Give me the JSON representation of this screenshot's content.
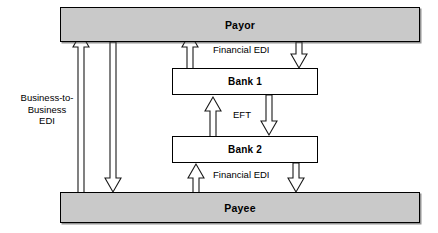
{
  "diagram": {
    "type": "flow-diagram",
    "nodes": [
      {
        "id": "payor",
        "label": "Payor",
        "kind": "party",
        "fill": "#c9c9c9"
      },
      {
        "id": "bank1",
        "label": "Bank 1",
        "kind": "bank",
        "fill": "#ffffff"
      },
      {
        "id": "bank2",
        "label": "Bank 2",
        "kind": "bank",
        "fill": "#ffffff"
      },
      {
        "id": "payee",
        "label": "Payee",
        "kind": "party",
        "fill": "#c9c9c9"
      }
    ],
    "labels": {
      "business_to_business_edi": "Business-to-\nBusiness\nEDI",
      "financial_edi_top": "Financial EDI",
      "eft": "EFT",
      "financial_edi_bottom": "Financial EDI"
    },
    "flows": [
      {
        "from": "payee",
        "to": "payor",
        "label": "Business-to-Business EDI",
        "direction": "up"
      },
      {
        "from": "payor",
        "to": "payee",
        "label": "Business-to-Business EDI",
        "direction": "down"
      },
      {
        "from": "bank1",
        "to": "payor",
        "label": "Financial EDI",
        "direction": "up"
      },
      {
        "from": "payor",
        "to": "bank1",
        "label": "Financial EDI",
        "direction": "down"
      },
      {
        "from": "bank2",
        "to": "bank1",
        "label": "EFT",
        "direction": "up"
      },
      {
        "from": "bank1",
        "to": "bank2",
        "label": "EFT",
        "direction": "down"
      },
      {
        "from": "payee",
        "to": "bank2",
        "label": "Financial EDI",
        "direction": "up"
      },
      {
        "from": "bank2",
        "to": "payee",
        "label": "Financial EDI",
        "direction": "down"
      }
    ],
    "colors": {
      "party_fill": "#c9c9c9",
      "bank_fill": "#ffffff",
      "stroke": "#000000",
      "page": "#ffffff"
    }
  }
}
